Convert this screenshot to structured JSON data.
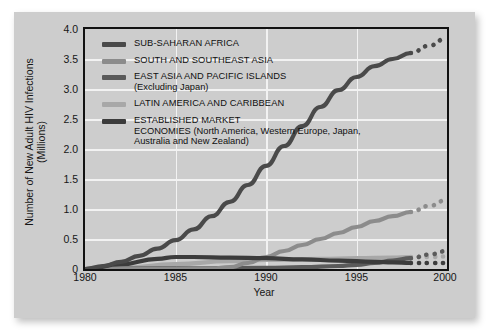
{
  "chart_data": {
    "type": "line",
    "title": "",
    "xlabel": "Year",
    "ylabel": "Number of New Adult HIV Infections (Millions)",
    "xlim": [
      1980,
      2000
    ],
    "ylim": [
      0,
      4.0
    ],
    "xticks": [
      "1980",
      "1985",
      "1990",
      "1995",
      "2000"
    ],
    "yticks": [
      "4.0",
      "3.5",
      "3.0",
      "2.5",
      "2.0",
      "1.5",
      "1.0",
      "0.5",
      "0"
    ],
    "grid": "white gridlines at every y tick and at x = 1985, 1990, 1995",
    "legend_position": "inside top-left of plot area",
    "projection_note": "dotted segments from 1998 to 2000 indicate projected values",
    "series": [
      {
        "name": "SUB-SAHARAN AFRICA",
        "color": "#4a4a4a",
        "x": [
          1980,
          1981,
          1982,
          1983,
          1984,
          1985,
          1986,
          1987,
          1988,
          1989,
          1990,
          1991,
          1992,
          1993,
          1994,
          1995,
          1996,
          1997,
          1998,
          1999,
          2000
        ],
        "values": [
          0.0,
          0.05,
          0.12,
          0.22,
          0.34,
          0.48,
          0.66,
          0.88,
          1.12,
          1.4,
          1.72,
          2.05,
          2.38,
          2.7,
          2.98,
          3.2,
          3.38,
          3.5,
          3.6,
          3.72,
          3.85
        ],
        "projected_from": 1998
      },
      {
        "name": "SOUTH AND SOUTHEAST ASIA",
        "color": "#8c8c8c",
        "x": [
          1980,
          1985,
          1987,
          1988,
          1989,
          1990,
          1991,
          1992,
          1993,
          1994,
          1995,
          1996,
          1997,
          1998,
          1999,
          2000
        ],
        "values": [
          0.0,
          0.0,
          0.01,
          0.03,
          0.1,
          0.2,
          0.3,
          0.4,
          0.5,
          0.6,
          0.7,
          0.8,
          0.88,
          0.95,
          1.05,
          1.15
        ],
        "projected_from": 1998
      },
      {
        "name": "EAST ASIA AND PACIFIC ISLANDS (Excluding Japan)",
        "color": "#5a5a5a",
        "x": [
          1980,
          1985,
          1990,
          1992,
          1994,
          1995,
          1996,
          1997,
          1998,
          1999,
          2000
        ],
        "values": [
          0.0,
          0.01,
          0.02,
          0.03,
          0.05,
          0.07,
          0.1,
          0.14,
          0.18,
          0.24,
          0.3
        ],
        "projected_from": 1998
      },
      {
        "name": "LATIN AMERICA AND CARIBBEAN",
        "color": "#a8a8a8",
        "x": [
          1980,
          1982,
          1985,
          1988,
          1990,
          1993,
          1995,
          1997,
          1998,
          1999,
          2000
        ],
        "values": [
          0.0,
          0.02,
          0.08,
          0.13,
          0.15,
          0.17,
          0.18,
          0.19,
          0.2,
          0.2,
          0.21
        ],
        "projected_from": 1998
      },
      {
        "name": "ESTABLISHED MARKET ECONOMIES (North America, Western Europe, Japan, Australia and New Zealand)",
        "color": "#3c3c3c",
        "x": [
          1980,
          1982,
          1984,
          1985,
          1986,
          1988,
          1990,
          1992,
          1994,
          1996,
          1997,
          1998,
          1999,
          2000
        ],
        "values": [
          0.0,
          0.08,
          0.17,
          0.2,
          0.2,
          0.19,
          0.18,
          0.16,
          0.14,
          0.12,
          0.11,
          0.1,
          0.1,
          0.1
        ],
        "projected_from": 1998
      }
    ]
  },
  "axes": {
    "ylabel_line1": "Number of New Adult HIV Infections",
    "ylabel_line2": "(Millions)",
    "xlabel": "Year",
    "yticks": [
      "4.0",
      "3.5",
      "3.0",
      "2.5",
      "2.0",
      "1.5",
      "1.0",
      "0.5",
      "0"
    ],
    "xticks": [
      "1980",
      "1985",
      "1990",
      "1995",
      "2000"
    ]
  },
  "legend": {
    "items": [
      {
        "label": "SUB-SAHARAN AFRICA",
        "sub": "",
        "color": "#4a4a4a"
      },
      {
        "label": "SOUTH AND SOUTHEAST ASIA",
        "sub": "",
        "color": "#8c8c8c"
      },
      {
        "label": "EAST ASIA AND PACIFIC ISLANDS",
        "sub": "(Excluding Japan)",
        "color": "#5a5a5a"
      },
      {
        "label": "LATIN AMERICA AND CARIBBEAN",
        "sub": "",
        "color": "#a8a8a8"
      },
      {
        "label": "ESTABLISHED MARKET",
        "sub": "ECONOMIES (North America, Western Europe, Japan, Australia and New Zealand)",
        "color": "#3c3c3c"
      }
    ]
  },
  "colors": {
    "card_background": "#cdcdcd",
    "plot_border": "#111111",
    "gridline": "#f2f2f2",
    "page_background": "#ffffff"
  }
}
